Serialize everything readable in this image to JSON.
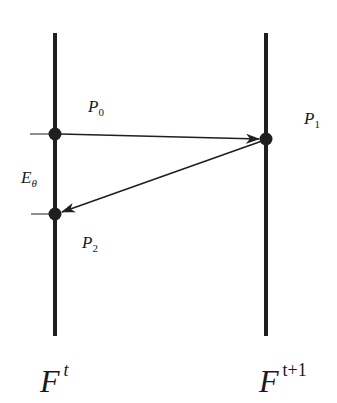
{
  "diagram": {
    "colors": {
      "line": "#1f1f1f",
      "background": "#ffffff"
    },
    "frames": [
      {
        "id": "frame-t",
        "label_base": "F",
        "label_sup": "t",
        "x": 55,
        "y_top": 33,
        "y_bottom": 336
      },
      {
        "id": "frame-t1",
        "label_base": "F",
        "label_sup": "t+1",
        "x": 266,
        "y_top": 33,
        "y_bottom": 336
      }
    ],
    "points": [
      {
        "id": "P0",
        "label_base": "P",
        "label_sub": "0",
        "x": 55,
        "y": 134,
        "frame": "F^t"
      },
      {
        "id": "P1",
        "label_base": "P",
        "label_sub": "1",
        "x": 266,
        "y": 139,
        "frame": "F^{t+1}"
      },
      {
        "id": "P2",
        "label_base": "P",
        "label_sub": "2",
        "x": 55,
        "y": 214,
        "frame": "F^t"
      }
    ],
    "arrows": [
      {
        "from": "P0",
        "to": "P1"
      },
      {
        "from": "P1",
        "to": "P2"
      }
    ],
    "error_label": {
      "base": "E",
      "sub": "θ"
    }
  },
  "labels": {
    "p0_base": "P",
    "p0_sub": "0",
    "p1_base": "P",
    "p1_sub": "1",
    "p2_base": "P",
    "p2_sub": "2",
    "e_base": "E",
    "e_sub": "θ",
    "ft_base": "F",
    "ft_sup": "t",
    "ft1_base": "F",
    "ft1_sup": "t+1"
  }
}
